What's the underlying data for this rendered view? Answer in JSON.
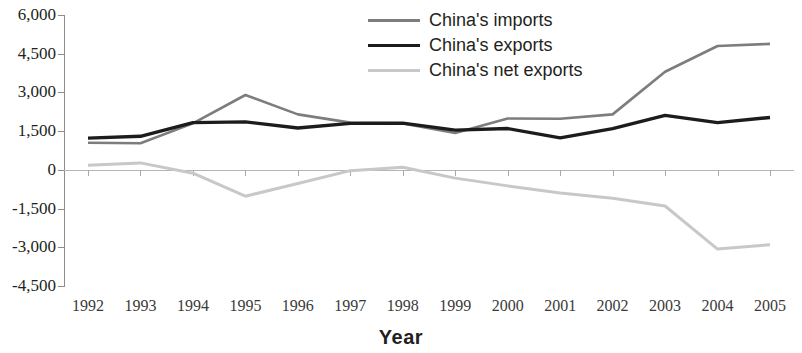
{
  "chart_data": {
    "type": "line",
    "title": "",
    "xlabel": "Year",
    "ylabel": "",
    "grid": false,
    "legend_position": "top-center",
    "x": [
      1992,
      1993,
      1994,
      1995,
      1996,
      1997,
      1998,
      1999,
      2000,
      2001,
      2002,
      2003,
      2004,
      2005
    ],
    "categories": [
      "1992",
      "1993",
      "1994",
      "1995",
      "1996",
      "1997",
      "1998",
      "1999",
      "2000",
      "2001",
      "2002",
      "2003",
      "2004",
      "2005"
    ],
    "ylim": [
      -4500,
      6000
    ],
    "yticks": [
      6000,
      4500,
      3000,
      1500,
      0,
      -1500,
      -3000,
      -4500
    ],
    "ytick_labels": [
      "6,000",
      "4,500",
      "3,000",
      "1,500",
      "0",
      "-1,500",
      "-3,000",
      "-4,500"
    ],
    "series": [
      {
        "name": "China's imports",
        "color": "#7d7d7d",
        "width": 2.6,
        "values": [
          1050,
          1030,
          1800,
          2900,
          2150,
          1830,
          1800,
          1430,
          1990,
          1980,
          2150,
          3800,
          4800,
          4880
        ]
      },
      {
        "name": "China's exports",
        "color": "#1c1c1c",
        "width": 3.4,
        "values": [
          1230,
          1300,
          1830,
          1860,
          1620,
          1800,
          1810,
          1540,
          1600,
          1240,
          1600,
          2110,
          1830,
          2030
        ]
      },
      {
        "name": "China's net exports",
        "color": "#c8c8c8",
        "width": 3.0,
        "values": [
          180,
          270,
          -130,
          -1020,
          -530,
          -30,
          100,
          -320,
          -620,
          -900,
          -1100,
          -1400,
          -3070,
          -2900
        ]
      }
    ]
  },
  "legend": {
    "items": [
      {
        "label": "China's imports",
        "color": "#7d7d7d"
      },
      {
        "label": "China's exports",
        "color": "#1c1c1c"
      },
      {
        "label": "China's net exports",
        "color": "#c8c8c8"
      }
    ]
  },
  "axis": {
    "x_title": "Year"
  }
}
